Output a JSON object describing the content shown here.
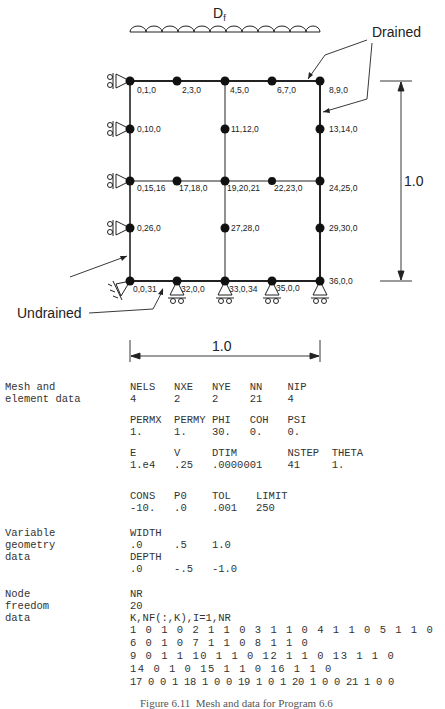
{
  "diagram": {
    "load_label": "D",
    "load_label_sub": "f",
    "drained_label": "Drained",
    "undrained_label": "Undrained",
    "height_dim_label": "1.0",
    "width_dim_label": "1.0",
    "nodes": [
      {
        "label": "0,1,0"
      },
      {
        "label": "2,3,0"
      },
      {
        "label": "4,5,0"
      },
      {
        "label": "6,7,0"
      },
      {
        "label": "8,9,0"
      },
      {
        "label": "0,10,0"
      },
      {
        "label": "11,12,0"
      },
      {
        "label": "13,14,0"
      },
      {
        "label": "0,15,16"
      },
      {
        "label": "17,18,0"
      },
      {
        "label": "19,20,21"
      },
      {
        "label": "22,23,0"
      },
      {
        "label": "24,25,0"
      },
      {
        "label": "0,26,0"
      },
      {
        "label": "27,28,0"
      },
      {
        "label": "29,30,0"
      },
      {
        "label": "0,0,31"
      },
      {
        "label": "32,0,0"
      },
      {
        "label": "33,0,34"
      },
      {
        "label": "35,0,0"
      },
      {
        "label": "36,0,0"
      }
    ]
  },
  "data_section": {
    "mesh": {
      "label_line1": "Mesh and",
      "label_line2": "element data",
      "rows": [
        {
          "headers": "NELS   NXE   NYE   NN    NIP",
          "values": "4      2     2     21    4"
        },
        {
          "headers": "PERMX  PERMY PHI   COH   PSI",
          "values": "1.     1.    30.   0.    0."
        },
        {
          "headers": "E      V     DTIM        NSTEP  THETA",
          "values": "1.e4   .25   .0000001    41     1."
        },
        {
          "headers": "CONS   P0    TOL    LIMIT",
          "values": "-10.   .0    .001   250"
        }
      ]
    },
    "geometry": {
      "label_line1": "Variable",
      "label_line2": "geometry",
      "label_line3": "data",
      "width_header": "WIDTH",
      "width_values": ".0     .5    1.0",
      "depth_header": "DEPTH",
      "depth_values": ".0     -.5   -1.0"
    },
    "freedom": {
      "label_line1": "Node",
      "label_line2": "freedom",
      "label_line3": "data",
      "nr_header": "NR",
      "nr_value": "20",
      "list_header": "K,NF(:,K),I=1,NR",
      "lines": [
        "1 0 1 0 2 1 1 0 3 1 1 0 4 1 1 0 5 1 1 0",
        "6 0 1 0 7 1 1 0 8 1 1 0",
        "9 0 1 1 10 1 1 0 12 1 1 0 13 1 1 0",
        "14 0 1 0 15 1 1 0 16 1 1 0",
        "17 0 0 1 18 1 0 0 19 1 0 1 20 1 0 0 21 1 0 0"
      ]
    }
  },
  "caption": "Figure 6.11  Mesh and data for Program 6.6"
}
